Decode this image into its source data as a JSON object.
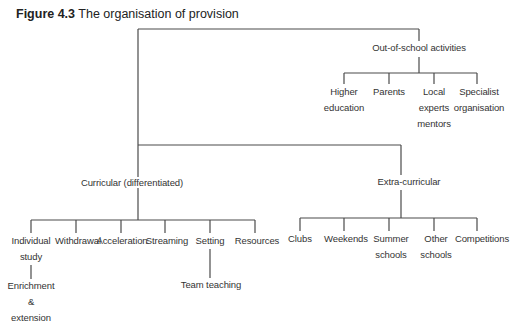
{
  "title": {
    "figure_label": "Figure 4.3",
    "caption": "The organisation of provision"
  },
  "nodes": {
    "out_of_school": {
      "label": "Out-of-school activities",
      "children": [
        {
          "lines": [
            "Higher",
            "education"
          ]
        },
        {
          "lines": [
            "Parents"
          ]
        },
        {
          "lines": [
            "Local",
            "experts",
            "mentors"
          ]
        },
        {
          "lines": [
            "Specialist",
            "organisation"
          ]
        }
      ]
    },
    "curricular": {
      "label": "Curricular (differentiated)",
      "children": [
        {
          "lines": [
            "Individual",
            "study"
          ]
        },
        {
          "lines": [
            "Withdrawal"
          ]
        },
        {
          "lines": [
            "Acceleration"
          ]
        },
        {
          "lines": [
            "Streaming"
          ]
        },
        {
          "lines": [
            "Setting"
          ]
        },
        {
          "lines": [
            "Resources"
          ]
        }
      ],
      "individual_study_child": {
        "lines": [
          "Enrichment",
          "&",
          "extension"
        ]
      },
      "setting_child": {
        "lines": [
          "Team teaching"
        ]
      }
    },
    "extra_curricular": {
      "label": "Extra-curricular",
      "children": [
        {
          "lines": [
            "Clubs"
          ]
        },
        {
          "lines": [
            "Weekends"
          ]
        },
        {
          "lines": [
            "Summer",
            "schools"
          ]
        },
        {
          "lines": [
            "Other",
            "schools"
          ]
        },
        {
          "lines": [
            "Competitions"
          ]
        }
      ]
    }
  }
}
